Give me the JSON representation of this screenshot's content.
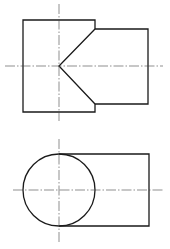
{
  "drawing": {
    "type": "orthographic-projection",
    "colors": {
      "outline": "#1a1a1a",
      "centerline": "#444444",
      "background": "#ffffff"
    },
    "front_view": {
      "large_block": {
        "x1": 23,
        "y1": 20,
        "x2": 95,
        "y2": 112
      },
      "small_block": {
        "x1": 95,
        "y1": 29,
        "x2": 148,
        "y2": 104
      },
      "cone_apex": {
        "x": 59,
        "y": 66
      },
      "centerline_vertical": {
        "x": 59,
        "y1": 4,
        "y2": 121
      },
      "centerline_horizontal": {
        "y": 66,
        "x1": 5,
        "x2": 163
      }
    },
    "top_view": {
      "circle": {
        "cx": 59,
        "cy": 190,
        "r": 36
      },
      "rect": {
        "x1": 59,
        "y1": 154,
        "x2": 149,
        "y2": 226
      },
      "centerline_vertical": {
        "x": 59,
        "y1": 139,
        "y2": 244
      },
      "centerline_horizontal": {
        "y": 190,
        "x1": 13,
        "x2": 163
      }
    }
  }
}
